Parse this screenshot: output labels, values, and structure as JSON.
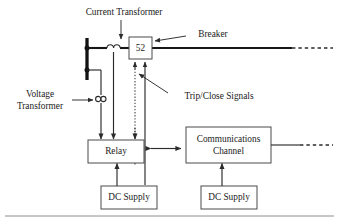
{
  "diagram": {
    "background_color": "#ffffff",
    "line_color": "#2b2b2b",
    "bus_color": "#121212",
    "box_stroke_color": "#4a4a4a",
    "blocks": [
      {
        "id": "breaker",
        "label": "52"
      },
      {
        "id": "relay",
        "label": "Relay"
      },
      {
        "id": "comms",
        "label_line1": "Communications",
        "label_line2": "Channel"
      },
      {
        "id": "dc_supply_relay",
        "label": "DC Supply"
      },
      {
        "id": "dc_supply_comms",
        "label": "DC Supply"
      }
    ],
    "callouts": [
      {
        "id": "current-transformer",
        "text": "Current Transformer"
      },
      {
        "id": "breaker",
        "text": "Breaker"
      },
      {
        "id": "trip-close-signals",
        "text": "Trip/Close Signals"
      },
      {
        "id": "voltage-transformer",
        "line1": "Voltage",
        "line2": "Transformer"
      }
    ],
    "symbols": [
      {
        "id": "bus-bar",
        "name": "bus-bar"
      },
      {
        "id": "current-transformer-symbol",
        "name": "current-transformer-symbol"
      },
      {
        "id": "voltage-transformer-symbol",
        "name": "voltage-transformer-symbol"
      }
    ],
    "connections": [
      {
        "id": "transmission-line-right",
        "style": "solid-then-dashed"
      },
      {
        "id": "comms-line-right",
        "style": "solid-then-dashed"
      },
      {
        "id": "relay-comms-link",
        "style": "bidirectional-arrow"
      },
      {
        "id": "trip-signal",
        "style": "dotted-arrow-up"
      },
      {
        "id": "close-signal",
        "style": "solid-arrow-up"
      }
    ]
  }
}
